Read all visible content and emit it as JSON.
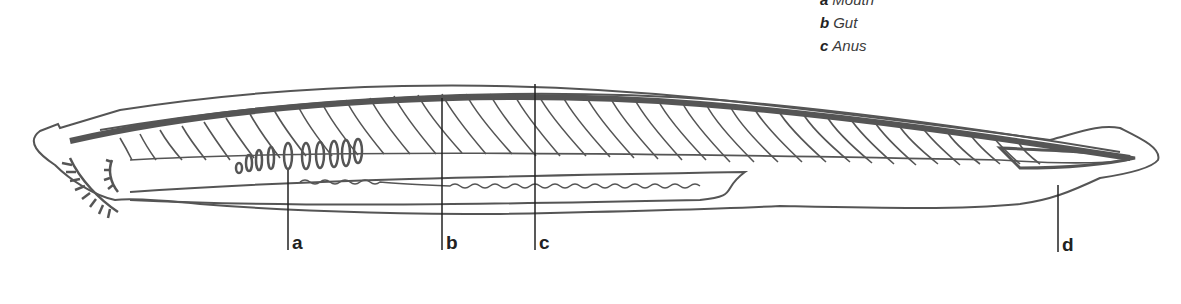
{
  "legend": {
    "items": [
      {
        "key": "a",
        "text": "Mouth"
      },
      {
        "key": "b",
        "text": "Gut"
      },
      {
        "key": "c",
        "text": "Anus"
      }
    ]
  },
  "labels": {
    "a": "a",
    "b": "b",
    "c": "c",
    "d": "d"
  },
  "diagram": {
    "stroke_color": "#555555"
  }
}
